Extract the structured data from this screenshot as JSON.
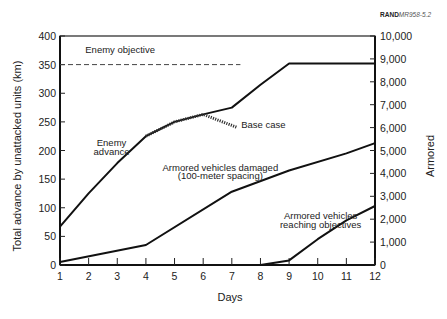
{
  "figure_id": {
    "bold": "RAND",
    "italic": "MR958-5.2"
  },
  "chart_data": {
    "type": "line",
    "title": "",
    "xlabel": "Days",
    "ylabel": "Total advance by unattacked units (km)",
    "ylabel_right": "Armored",
    "x": [
      1,
      2,
      3,
      4,
      5,
      6,
      7,
      8,
      9,
      10,
      11,
      12
    ],
    "xlim": [
      1,
      12
    ],
    "ylim": [
      0,
      400
    ],
    "ylim_right": [
      0,
      10000
    ],
    "yticks_left": [
      "0",
      "50",
      "100",
      "150",
      "200",
      "250",
      "300",
      "350",
      "400"
    ],
    "yticks_right": [
      "0",
      "1,000",
      "2,000",
      "3,000",
      "4,000",
      "5,000",
      "6,000",
      "7,000",
      "8,000",
      "9,000",
      "10,000"
    ],
    "xticks": [
      "1",
      "2",
      "3",
      "4",
      "5",
      "6",
      "7",
      "8",
      "9",
      "10",
      "11",
      "12"
    ],
    "grid": false,
    "series": [
      {
        "name": "Enemy advance",
        "axis": "left",
        "style": "solid",
        "points": [
          [
            1,
            67
          ],
          [
            2,
            125
          ],
          [
            3,
            178
          ],
          [
            4,
            225
          ],
          [
            5,
            250
          ],
          [
            6,
            263
          ],
          [
            7,
            275
          ],
          [
            8,
            315
          ],
          [
            9,
            352
          ],
          [
            10,
            352
          ],
          [
            11,
            352
          ],
          [
            12,
            352
          ]
        ]
      },
      {
        "name": "Base case",
        "axis": "left",
        "style": "dotted",
        "points": [
          [
            4,
            225
          ],
          [
            5,
            250
          ],
          [
            6,
            263
          ],
          [
            7.2,
            240
          ]
        ]
      },
      {
        "name": "Armored vehicles damaged (100-meter spacing)",
        "axis": "right",
        "style": "solid",
        "points": [
          [
            1,
            125
          ],
          [
            4,
            875
          ],
          [
            7,
            3200
          ],
          [
            9,
            4125
          ],
          [
            11,
            4875
          ],
          [
            12,
            5325
          ]
        ]
      },
      {
        "name": "Armored vehicles reaching objectives",
        "axis": "right",
        "style": "solid",
        "points": [
          [
            8,
            0
          ],
          [
            9,
            200
          ],
          [
            10,
            1125
          ],
          [
            11,
            1950
          ],
          [
            12,
            2575
          ]
        ]
      },
      {
        "name": "Enemy objective",
        "axis": "left",
        "style": "dashed",
        "points": [
          [
            1,
            350
          ],
          [
            7.3,
            350
          ]
        ]
      }
    ],
    "annotations": [
      {
        "text": "Enemy objective",
        "x": 3.1,
        "y": 370
      },
      {
        "text": "Enemy",
        "x": 2.8,
        "y": 207
      },
      {
        "text": "advance",
        "x": 2.8,
        "y": 192
      },
      {
        "text": "Base case",
        "x": 8.1,
        "y": 240
      },
      {
        "text": "Armored vehicles damaged",
        "x": 6.6,
        "y": 165
      },
      {
        "text": "(100-meter spacing)",
        "x": 6.6,
        "y": 150
      },
      {
        "text": "Armored vehicles",
        "x": 10.1,
        "y": 80
      },
      {
        "text": "reaching objectives",
        "x": 10.1,
        "y": 65
      }
    ]
  }
}
